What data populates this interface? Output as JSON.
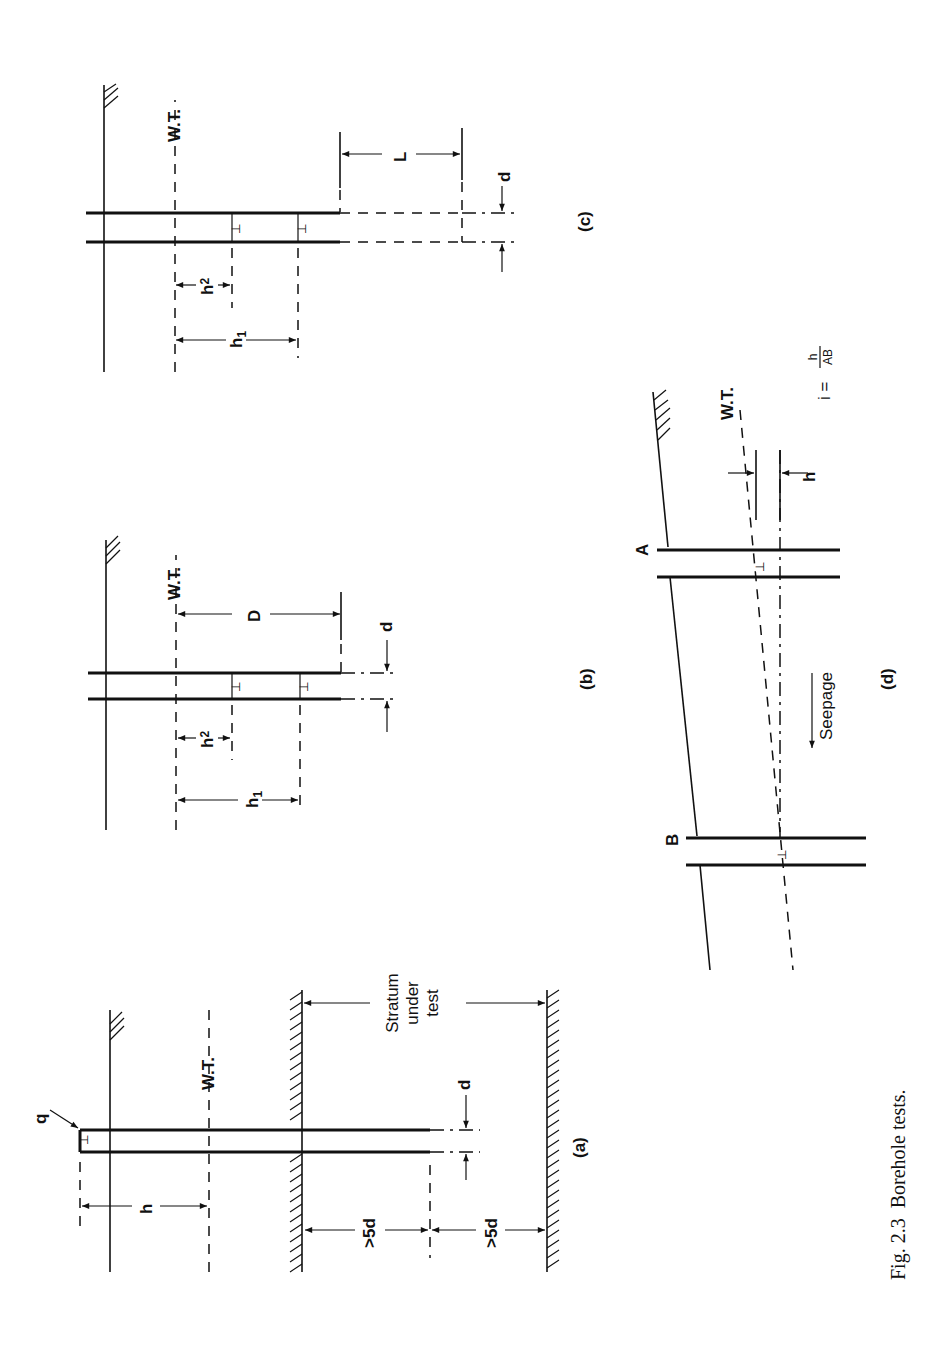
{
  "figure": {
    "caption_number": "Fig. 2.3",
    "caption_text": "Borehole tests.",
    "orientation": "rotated 90° counter-clockwise"
  },
  "panels": {
    "a": {
      "label": "(a)",
      "flow_label": "q",
      "water_table": "W.T.",
      "head_label": "h",
      "diameter_label": "d",
      "stratum_label_1": "Stratum",
      "stratum_label_2": "under",
      "stratum_label_3": "test",
      "depth_label_1": ">5d",
      "depth_label_2": ">5d"
    },
    "b": {
      "label": "(b)",
      "water_table": "W.T.",
      "depth_label": "D",
      "diameter_label": "d",
      "h1_label": "h",
      "h1_sub": "1",
      "h2_label": "h",
      "h2_sub": "2"
    },
    "c": {
      "label": "(c)",
      "water_table": "W.T.",
      "length_label": "L",
      "diameter_label": "d",
      "h1_label": "h",
      "h1_sub": "1",
      "h2_label": "h",
      "h2_sub": "2"
    },
    "d": {
      "label": "(d)",
      "water_table": "W.T.",
      "point_a": "A",
      "point_b": "B",
      "head_label": "h",
      "seepage_label": "Seepage",
      "formula_lhs": "i =",
      "formula_num": "h",
      "formula_den": "AB"
    }
  }
}
